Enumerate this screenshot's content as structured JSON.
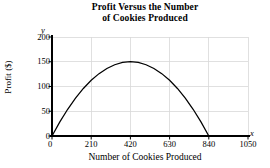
{
  "chart_data": {
    "type": "line",
    "title": "Profit Versus the Number of Cookies Produced",
    "title_lines": [
      "Profit Versus the Number",
      "of Cookies Produced"
    ],
    "xlabel": "Number of Cookies Produced",
    "ylabel": "Profit ($)",
    "x_axis_symbol": "x",
    "y_axis_symbol": "y",
    "xlim": [
      0,
      1050
    ],
    "ylim": [
      0,
      200
    ],
    "xticks": [
      0,
      210,
      420,
      630,
      840,
      1050
    ],
    "xtick_labels": [
      "0",
      "210",
      "420",
      "630",
      "840",
      "1050"
    ],
    "yticks": [
      0,
      50,
      100,
      150,
      200
    ],
    "ytick_labels": [
      "0",
      "50",
      "100",
      "150",
      "200"
    ],
    "grid": true,
    "legend": null,
    "curve": {
      "name": "Profit",
      "shape": "downward parabola",
      "roots": [
        0,
        840
      ],
      "vertex": {
        "x": 420,
        "y": 150
      },
      "color": "#000000",
      "x": [
        0,
        42,
        84,
        126,
        168,
        210,
        252,
        294,
        336,
        378,
        420,
        462,
        504,
        546,
        588,
        630,
        672,
        714,
        756,
        798,
        840
      ],
      "y": [
        0,
        28.5,
        54,
        76.5,
        96,
        112.5,
        126,
        136.5,
        144,
        148.5,
        150,
        148.5,
        144,
        136.5,
        126,
        112.5,
        96,
        76.5,
        54,
        28.5,
        0
      ]
    }
  },
  "colors": {
    "curve": "#000000",
    "axis": "#000000",
    "grid": "#d8d8d8",
    "background": "#ffffff",
    "text": "#000000"
  }
}
